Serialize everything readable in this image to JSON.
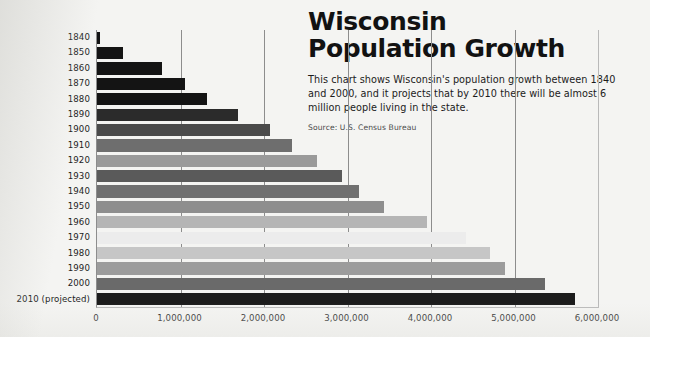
{
  "headline": {
    "line1": "Wisconsin",
    "line2": "Population Growth",
    "description": "This chart shows Wisconsin's population growth between 1840 and 2000, and it projects that by 2010 there will be almost 6 million people living in the state.",
    "source": "Source: U.S. Census Bureau"
  },
  "chart_data": {
    "type": "bar",
    "orientation": "horizontal",
    "title": "Wisconsin Population Growth",
    "subtitle": "This chart shows Wisconsin's population growth between 1840 and 2000, and it projects that by 2010 there will be almost 6 million people living in the state.",
    "source": "Source: U.S. Census Bureau",
    "xlabel": "",
    "ylabel": "",
    "xlim": [
      0,
      6000000
    ],
    "grid": true,
    "legend": false,
    "xticks": [
      0,
      1000000,
      2000000,
      3000000,
      4000000,
      5000000,
      6000000
    ],
    "xticklabels": [
      "0",
      "1,000,000",
      "2,000,000",
      "3,000,000",
      "4,000,000",
      "5,000,000",
      "6,000,000"
    ],
    "categories": [
      "1840",
      "1850",
      "1860",
      "1870",
      "1880",
      "1890",
      "1900",
      "1910",
      "1920",
      "1930",
      "1940",
      "1950",
      "1960",
      "1970",
      "1980",
      "1990",
      "2000",
      "2010 (projected)"
    ],
    "values": [
      30945,
      305391,
      775881,
      1054670,
      1315497,
      1693330,
      2069042,
      2333860,
      2632067,
      2939006,
      3137587,
      3434575,
      3951777,
      4417731,
      4705767,
      4891769,
      5363675,
      5727426
    ],
    "bar_colors": [
      "#141414",
      "#141414",
      "#141414",
      "#141414",
      "#141414",
      "#2b2b2b",
      "#4a4a4a",
      "#6e6e6e",
      "#9a9a9a",
      "#5a5a5a",
      "#707070",
      "#8e8e8e",
      "#b5b5b5",
      "#ececec",
      "#c6c6c6",
      "#9c9c9c",
      "#6a6a6a",
      "#1c1c1c"
    ]
  }
}
